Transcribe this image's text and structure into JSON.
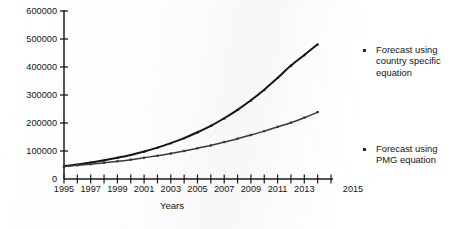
{
  "chart_data": {
    "type": "line",
    "title": "",
    "xlabel": "Years",
    "ylabel": "",
    "xlim": [
      1995,
      2015
    ],
    "ylim": [
      0,
      600000
    ],
    "grid": false,
    "legend_position": "right",
    "x": [
      1995,
      1996,
      1997,
      1998,
      1999,
      2000,
      2001,
      2002,
      2003,
      2004,
      2005,
      2006,
      2007,
      2008,
      2009,
      2010,
      2011,
      2012,
      2013,
      2014
    ],
    "xtick_labels": [
      "1995",
      "1997",
      "1999",
      "2001",
      "2003",
      "2005",
      "2007",
      "2009",
      "2011",
      "2013",
      "2015"
    ],
    "xtick_values": [
      1995,
      1997,
      1999,
      2001,
      2003,
      2005,
      2007,
      2009,
      2011,
      2013,
      2015
    ],
    "ytick_labels": [
      "0",
      "100000",
      "200000",
      "300000",
      "400000",
      "500000",
      "600000"
    ],
    "ytick_values": [
      0,
      100000,
      200000,
      300000,
      400000,
      500000,
      600000
    ],
    "series": [
      {
        "name": "Forecast using country specific equation",
        "marker": "triangle",
        "color": "#151515",
        "values": [
          46000,
          52000,
          59000,
          67000,
          76000,
          86000,
          98000,
          112000,
          128000,
          146000,
          167000,
          190000,
          217000,
          247000,
          281000,
          319000,
          361000,
          405000,
          443000,
          481000
        ]
      },
      {
        "name": "Forecast using PMG equation",
        "marker": "square",
        "color": "#3a3a3a",
        "values": [
          45000,
          49000,
          53000,
          58000,
          63000,
          69000,
          76000,
          83000,
          91000,
          100000,
          110000,
          120000,
          132000,
          144000,
          157000,
          171000,
          186000,
          201000,
          219000,
          239000
        ]
      }
    ]
  },
  "axis": {
    "x_title": "Years"
  },
  "legend": {
    "entries": [
      {
        "label": "Forecast using\ncountry specific\nequation"
      },
      {
        "label": "Forecast using\nPMG equation"
      }
    ]
  }
}
